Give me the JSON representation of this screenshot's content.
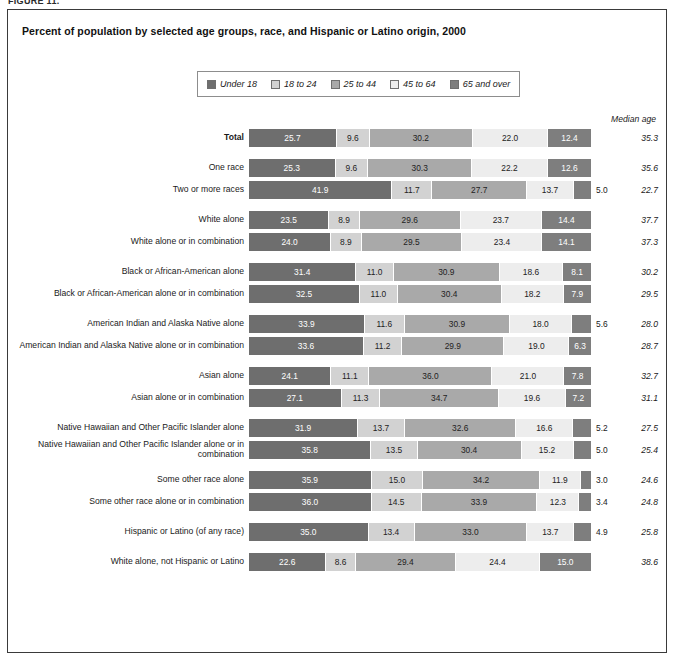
{
  "figure_tag": "FIGURE 11.",
  "chart_title": "Percent of population by selected age groups, race, and Hispanic or Latino origin, 2000",
  "median_age_header": "Median age",
  "legend": {
    "items": [
      {
        "label": "Under 18",
        "color": "#6e6e6e"
      },
      {
        "label": "18 to 24",
        "color": "#d2d2d2"
      },
      {
        "label": "25 to 44",
        "color": "#a9a9a9"
      },
      {
        "label": "45 to 64",
        "color": "#ededed"
      },
      {
        "label": "65 and over",
        "color": "#7e7e7e"
      }
    ]
  },
  "chart_data": {
    "type": "bar",
    "orientation": "horizontal",
    "stacked": true,
    "title": "Percent of population by selected age groups, race, and Hispanic or Latino origin, 2000",
    "xlabel": "",
    "ylabel": "",
    "xlim": [
      0,
      100
    ],
    "grid": false,
    "legend_position": "top-center",
    "series": [
      {
        "name": "Under 18",
        "color": "#6e6e6e"
      },
      {
        "name": "18 to 24",
        "color": "#d2d2d2"
      },
      {
        "name": "25 to 44",
        "color": "#a9a9a9"
      },
      {
        "name": "45 to 64",
        "color": "#ededed"
      },
      {
        "name": "65 and over",
        "color": "#7e7e7e"
      }
    ],
    "extra_columns": [
      "Median age"
    ],
    "rows": [
      {
        "label": "Total",
        "bold": true,
        "group_start": false,
        "values": [
          25.7,
          9.6,
          30.2,
          22.0,
          12.4
        ],
        "median_age": "35.3"
      },
      {
        "label": "One race",
        "bold": false,
        "group_start": true,
        "values": [
          25.3,
          9.6,
          30.3,
          22.2,
          12.6
        ],
        "median_age": "35.6"
      },
      {
        "label": "Two or more races",
        "bold": false,
        "group_start": false,
        "values": [
          41.9,
          11.7,
          27.7,
          13.7,
          5.0
        ],
        "last_outside": true,
        "median_age": "22.7"
      },
      {
        "label": "White alone",
        "bold": false,
        "group_start": true,
        "values": [
          23.5,
          8.9,
          29.6,
          23.7,
          14.4
        ],
        "median_age": "37.7"
      },
      {
        "label": "White alone or in combination",
        "bold": false,
        "group_start": false,
        "values": [
          24.0,
          8.9,
          29.5,
          23.4,
          14.1
        ],
        "median_age": "37.3"
      },
      {
        "label": "Black or African-American alone",
        "bold": false,
        "group_start": true,
        "values": [
          31.4,
          11.0,
          30.9,
          18.6,
          8.1
        ],
        "median_age": "30.2"
      },
      {
        "label": "Black or African-American alone or in combination",
        "bold": false,
        "group_start": false,
        "values": [
          32.5,
          11.0,
          30.4,
          18.2,
          7.9
        ],
        "median_age": "29.5"
      },
      {
        "label": "American Indian and Alaska Native alone",
        "bold": false,
        "group_start": true,
        "values": [
          33.9,
          11.6,
          30.9,
          18.0,
          5.6
        ],
        "last_outside": true,
        "median_age": "28.0"
      },
      {
        "label": "American Indian and Alaska Native alone or in combination",
        "bold": false,
        "group_start": false,
        "values": [
          33.6,
          11.2,
          29.9,
          19.0,
          6.3
        ],
        "median_age": "28.7"
      },
      {
        "label": "Asian alone",
        "bold": false,
        "group_start": true,
        "values": [
          24.1,
          11.1,
          36.0,
          21.0,
          7.8
        ],
        "median_age": "32.7"
      },
      {
        "label": "Asian alone or in combination",
        "bold": false,
        "group_start": false,
        "values": [
          27.1,
          11.3,
          34.7,
          19.6,
          7.2
        ],
        "median_age": "31.1"
      },
      {
        "label": "Native Hawaiian and Other Pacific Islander alone",
        "bold": false,
        "group_start": true,
        "values": [
          31.9,
          13.7,
          32.6,
          16.6,
          5.2
        ],
        "last_outside": true,
        "median_age": "27.5"
      },
      {
        "label": "Native Hawaiian and Other Pacific Islander alone or in combination",
        "bold": false,
        "group_start": false,
        "two_line": true,
        "values": [
          35.8,
          13.5,
          30.4,
          15.2,
          5.0
        ],
        "last_outside": true,
        "median_age": "25.4"
      },
      {
        "label": "Some other race alone",
        "bold": false,
        "group_start": true,
        "values": [
          35.9,
          15.0,
          34.2,
          11.9,
          3.0
        ],
        "last_outside": true,
        "median_age": "24.6"
      },
      {
        "label": "Some other race alone or in combination",
        "bold": false,
        "group_start": false,
        "values": [
          36.0,
          14.5,
          33.9,
          12.3,
          3.4
        ],
        "last_outside": true,
        "median_age": "24.8"
      },
      {
        "label": "Hispanic or Latino (of any race)",
        "bold": false,
        "group_start": true,
        "values": [
          35.0,
          13.4,
          33.0,
          13.7,
          4.9
        ],
        "last_outside": true,
        "median_age": "25.8"
      },
      {
        "label": "White alone, not Hispanic or Latino",
        "bold": false,
        "group_start": true,
        "values": [
          22.6,
          8.6,
          29.4,
          24.4,
          15.0
        ],
        "median_age": "38.6"
      }
    ]
  }
}
